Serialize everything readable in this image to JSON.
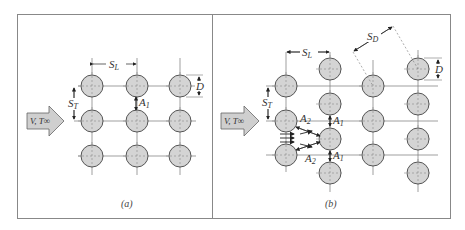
{
  "figure": {
    "panels": [
      {
        "id": "a",
        "caption": "(a)",
        "arrangement": "aligned",
        "flow_label": "V, T∞",
        "labels": {
          "SL": "S",
          "SL_sub": "L",
          "ST": "S",
          "ST_sub": "T",
          "D": "D",
          "A1": "A",
          "A1_sub": "1"
        }
      },
      {
        "id": "b",
        "caption": "(b)",
        "arrangement": "staggered",
        "flow_label": "V, T∞",
        "labels": {
          "SL": "S",
          "SL_sub": "L",
          "ST": "S",
          "ST_sub": "T",
          "SD": "S",
          "SD_sub": "D",
          "D": "D",
          "A1": "A",
          "A1_sub": "1",
          "A2": "A",
          "A2_sub": "2"
        }
      }
    ],
    "colors": {
      "tube_fill": "#d4d4d4",
      "tube_stroke": "#555555",
      "line": "#777777",
      "arrow_fill": "#cfcfcf",
      "border": "#888888"
    }
  }
}
